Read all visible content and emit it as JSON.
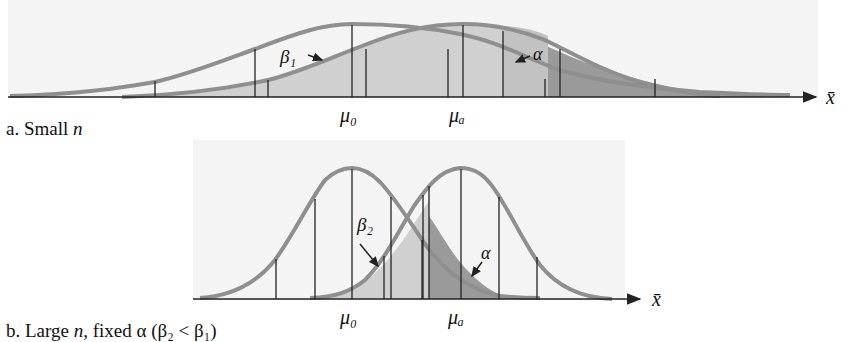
{
  "figure": {
    "panels": [
      {
        "id": "a",
        "caption_prefix": "a. Small ",
        "caption_var": "n",
        "labels": {
          "mu0": "μ₀",
          "mua": "μₐ",
          "beta": "β₁",
          "alpha": "α",
          "axis": "x̄"
        }
      },
      {
        "id": "b",
        "caption_prefix": "b. Large ",
        "caption_var": "n",
        "caption_rest": ", fixed α (β₂ < β₁)",
        "labels": {
          "mu0": "μ₀",
          "mua": "μₐ",
          "beta": "β₂",
          "alpha": "α",
          "axis": "x̄"
        }
      }
    ],
    "colors": {
      "curve": "#8f8f8f",
      "beta_fill": "#d0d0d0",
      "alpha_fill": "#9a9a9a",
      "axis": "#222222",
      "background": "#f4f4f4"
    }
  }
}
